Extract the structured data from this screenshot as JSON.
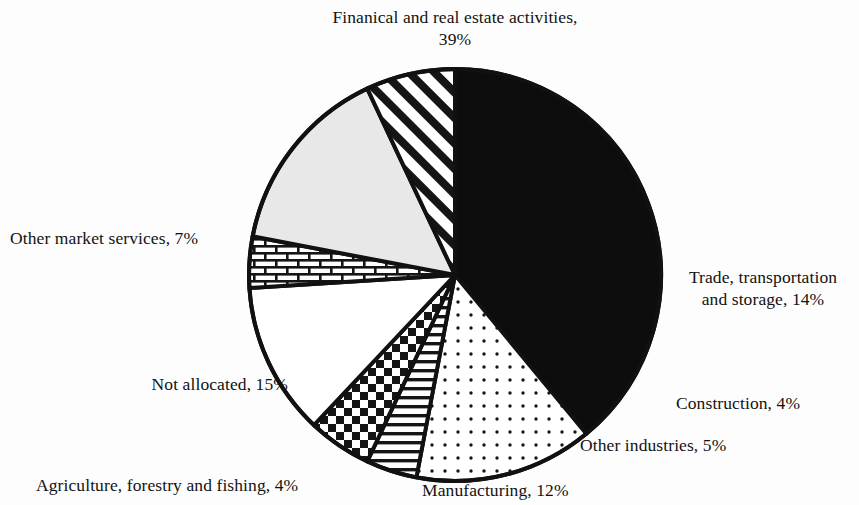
{
  "chart_data": {
    "type": "pie",
    "title": "",
    "units": "percent",
    "total": 100,
    "categories": [
      "Finanical and real estate activities",
      "Trade, transportation and storage",
      "Construction",
      "Other industries",
      "Manufacturing",
      "Agriculture, forestry and fishing",
      "Not allocated",
      "Other market services"
    ],
    "values": [
      39,
      14,
      4,
      5,
      12,
      4,
      15,
      7
    ],
    "slices": [
      {
        "label": "Finanical and real estate activities",
        "value": 39,
        "value_text": "39%",
        "label_text": "Finanical and real estate activities,\n39%",
        "fill": "solid-black",
        "color": "#0d0d0d",
        "start_angle": 0,
        "end_angle": 140.4
      },
      {
        "label": "Trade, transportation and storage",
        "value": 14,
        "value_text": "14%",
        "label_text": "Trade, transportation\nand storage, 14%",
        "fill": "dots",
        "color": "#ffffff",
        "start_angle": 140.4,
        "end_angle": 190.8
      },
      {
        "label": "Construction",
        "value": 4,
        "value_text": "4%",
        "label_text": "Construction, 4%",
        "fill": "horizontal-lines",
        "color": "#ffffff",
        "start_angle": 190.8,
        "end_angle": 205.2
      },
      {
        "label": "Other industries",
        "value": 5,
        "value_text": "5%",
        "label_text": "Other industries, 5%",
        "fill": "checkerboard",
        "color": "#ffffff",
        "start_angle": 205.2,
        "end_angle": 223.2
      },
      {
        "label": "Manufacturing",
        "value": 12,
        "value_text": "12%",
        "label_text": "Manufacturing, 12%",
        "fill": "white",
        "color": "#ffffff",
        "start_angle": 223.2,
        "end_angle": 266.4
      },
      {
        "label": "Agriculture, forestry and fishing",
        "value": 4,
        "value_text": "4%",
        "label_text": "Agriculture, forestry and fishing, 4%",
        "fill": "brick",
        "color": "#ffffff",
        "start_angle": 266.4,
        "end_angle": 280.8
      },
      {
        "label": "Not allocated",
        "value": 15,
        "value_text": "15%",
        "label_text": "Not allocated, 15%",
        "fill": "light-gray",
        "color": "#e6e6e6",
        "start_angle": 280.8,
        "end_angle": 334.8
      },
      {
        "label": "Other market services",
        "value": 7,
        "value_text": "7%",
        "label_text": "Other market services, 7%",
        "fill": "diagonal-hatch",
        "color": "#ffffff",
        "start_angle": 334.8,
        "end_angle": 360
      }
    ],
    "legend": "none",
    "outline_color": "#111111"
  },
  "labels": {
    "financial": "Finanical and real estate activities,\n39%",
    "trade": "Trade, transportation\nand storage, 14%",
    "construction": "Construction, 4%",
    "other_industries": "Other industries, 5%",
    "manufacturing": "Manufacturing, 12%",
    "agriculture": "Agriculture, forestry and fishing, 4%",
    "not_allocated": "Not allocated, 15%",
    "other_market_services": "Other market services, 7%"
  }
}
